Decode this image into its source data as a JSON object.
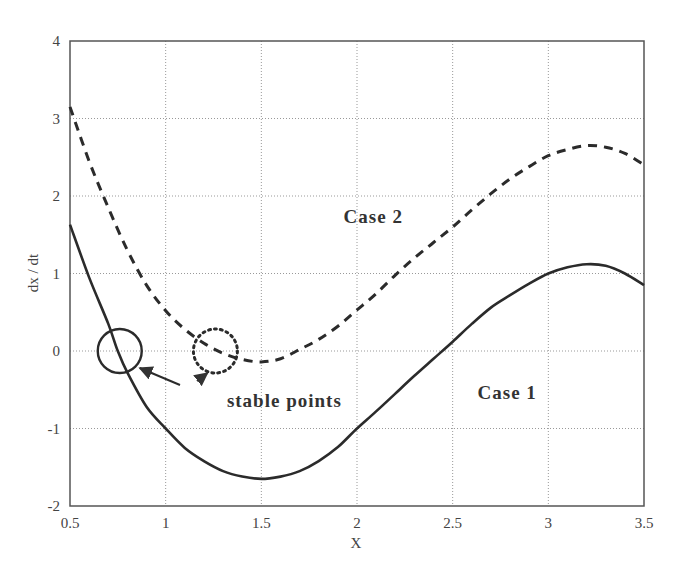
{
  "chart_data": {
    "type": "line",
    "title": "",
    "xlabel": "X",
    "ylabel": "dx / dt",
    "xlim": [
      0.5,
      3.5
    ],
    "ylim": [
      -2,
      4
    ],
    "xticks": [
      0.5,
      1,
      1.5,
      2,
      2.5,
      3,
      3.5
    ],
    "xtick_labels": [
      "0.5",
      "1",
      "1.5",
      "2",
      "2.5",
      "3",
      "3.5"
    ],
    "yticks": [
      -2,
      -1,
      0,
      1,
      2,
      3,
      4
    ],
    "ytick_labels": [
      "-2",
      "-1",
      "0",
      "1",
      "2",
      "3",
      "4"
    ],
    "grid": true,
    "legend": "none (inline labels)",
    "series": [
      {
        "name": "Case 1",
        "style": "solid",
        "color": "#333333",
        "x": [
          0.5,
          0.6,
          0.7,
          0.75,
          0.8,
          0.9,
          1.0,
          1.1,
          1.2,
          1.3,
          1.4,
          1.5,
          1.6,
          1.7,
          1.8,
          1.9,
          2.0,
          2.1,
          2.2,
          2.3,
          2.4,
          2.5,
          2.6,
          2.7,
          2.8,
          2.9,
          3.0,
          3.1,
          3.2,
          3.3,
          3.4,
          3.5
        ],
        "values": [
          1.63,
          0.95,
          0.35,
          0.0,
          -0.28,
          -0.72,
          -1.0,
          -1.25,
          -1.42,
          -1.55,
          -1.62,
          -1.65,
          -1.62,
          -1.55,
          -1.42,
          -1.24,
          -1.0,
          -0.78,
          -0.55,
          -0.32,
          -0.1,
          0.12,
          0.35,
          0.56,
          0.72,
          0.87,
          1.0,
          1.08,
          1.12,
          1.1,
          1.0,
          0.85
        ]
      },
      {
        "name": "Case 2",
        "style": "dashed",
        "color": "#333333",
        "x": [
          0.5,
          0.6,
          0.7,
          0.8,
          0.9,
          1.0,
          1.1,
          1.2,
          1.3,
          1.4,
          1.5,
          1.6,
          1.7,
          1.8,
          1.9,
          2.0,
          2.1,
          2.2,
          2.3,
          2.4,
          2.5,
          2.6,
          2.7,
          2.8,
          2.9,
          3.0,
          3.1,
          3.2,
          3.3,
          3.4,
          3.5
        ],
        "values": [
          3.15,
          2.45,
          1.85,
          1.3,
          0.85,
          0.52,
          0.28,
          0.1,
          -0.03,
          -0.11,
          -0.14,
          -0.1,
          0.02,
          0.15,
          0.32,
          0.53,
          0.74,
          0.98,
          1.2,
          1.4,
          1.6,
          1.82,
          2.03,
          2.22,
          2.38,
          2.52,
          2.6,
          2.65,
          2.63,
          2.55,
          2.4
        ]
      }
    ],
    "annotations": [
      {
        "text": "Case 2",
        "x": 1.93,
        "y": 1.65,
        "bold": true
      },
      {
        "text": "Case 1",
        "x": 2.63,
        "y": -0.62,
        "bold": true
      },
      {
        "text": "stable points",
        "x": 1.32,
        "y": -0.72,
        "bold": true
      },
      {
        "type": "circle",
        "style": "solid",
        "cx": 0.76,
        "cy": 0.0,
        "r_px": 22,
        "label": "Case 1 stable point"
      },
      {
        "type": "circle",
        "style": "dotted",
        "cx": 1.26,
        "cy": 0.0,
        "r_px": 22,
        "label": "Case 2 stable point"
      }
    ]
  },
  "labels": {
    "xlabel": "X",
    "ylabel": "dx / dt",
    "case1": "Case 1",
    "case2": "Case 2",
    "stable": "stable points"
  }
}
